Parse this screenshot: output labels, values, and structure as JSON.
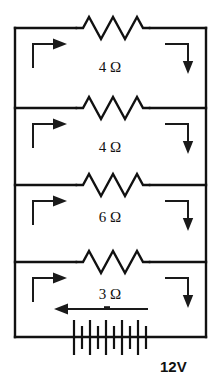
{
  "diagram": {
    "type": "electrical-schematic"
  },
  "branches": [
    {
      "id": "branch-1",
      "resistance_label": "4 Ω",
      "resistance_value": 4,
      "unit": "Ω",
      "left_arrow": "current-arrow-down-then-right",
      "right_arrow": "current-arrow-right-then-down"
    },
    {
      "id": "branch-2",
      "resistance_label": "4 Ω",
      "resistance_value": 4,
      "unit": "Ω",
      "left_arrow": "current-arrow-down-then-right",
      "right_arrow": "current-arrow-right-then-down"
    },
    {
      "id": "branch-3",
      "resistance_label": "6 Ω",
      "resistance_value": 6,
      "unit": "Ω",
      "left_arrow": "current-arrow-down-then-right",
      "right_arrow": "current-arrow-right-then-down"
    },
    {
      "id": "branch-4",
      "resistance_label": "3 Ω",
      "resistance_value": 3,
      "unit": "Ω",
      "left_arrow": "current-arrow-down-then-right",
      "right_arrow": "current-arrow-right-then-down"
    }
  ],
  "battery": {
    "label": "12V",
    "voltage": 12,
    "unit": "V",
    "symbol": "battery-multicell",
    "current_arrow": "current-arrow-left"
  },
  "colors": {
    "wire": "#111111",
    "background": "#ffffff",
    "arrow": "#1a1a1a"
  }
}
